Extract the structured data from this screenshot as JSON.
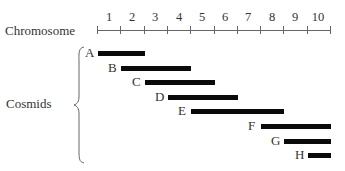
{
  "chart_data": {
    "type": "diagram",
    "title": "",
    "axis": {
      "label": "Chromosome",
      "segments": [
        "1",
        "2",
        "3",
        "4",
        "5",
        "6",
        "7",
        "8",
        "9",
        "10"
      ],
      "range": [
        0,
        10
      ]
    },
    "group_label": "Cosmids",
    "cosmids": [
      {
        "name": "A",
        "start": 0.0,
        "end": 2.0
      },
      {
        "name": "B",
        "start": 1.0,
        "end": 4.0
      },
      {
        "name": "C",
        "start": 2.0,
        "end": 5.0
      },
      {
        "name": "D",
        "start": 3.0,
        "end": 6.0
      },
      {
        "name": "E",
        "start": 4.0,
        "end": 8.0
      },
      {
        "name": "F",
        "start": 7.0,
        "end": 10.0
      },
      {
        "name": "G",
        "start": 8.0,
        "end": 10.0
      },
      {
        "name": "H",
        "start": 9.0,
        "end": 10.0
      }
    ]
  },
  "colors": {
    "bar": "#0a0a0a",
    "axis": "#666666",
    "text": "#333333"
  }
}
